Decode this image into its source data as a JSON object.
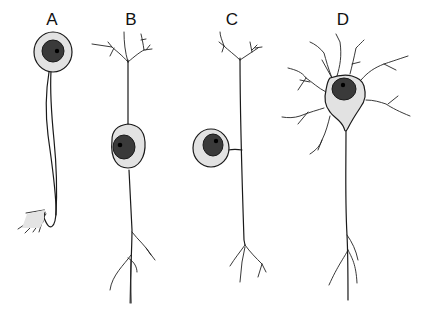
{
  "figure": {
    "type": "diagram",
    "colors": {
      "background": "#ffffff",
      "outline": "#1a1a1a",
      "soma_fill": "#e2e2e2",
      "nucleus_fill": "#3a3a3a"
    },
    "panels": [
      {
        "label": "A",
        "label_x": 52,
        "label_y": 10
      },
      {
        "label": "B",
        "label_x": 131,
        "label_y": 10
      },
      {
        "label": "C",
        "label_x": 232,
        "label_y": 10
      },
      {
        "label": "D",
        "label_x": 343,
        "label_y": 10
      }
    ]
  }
}
